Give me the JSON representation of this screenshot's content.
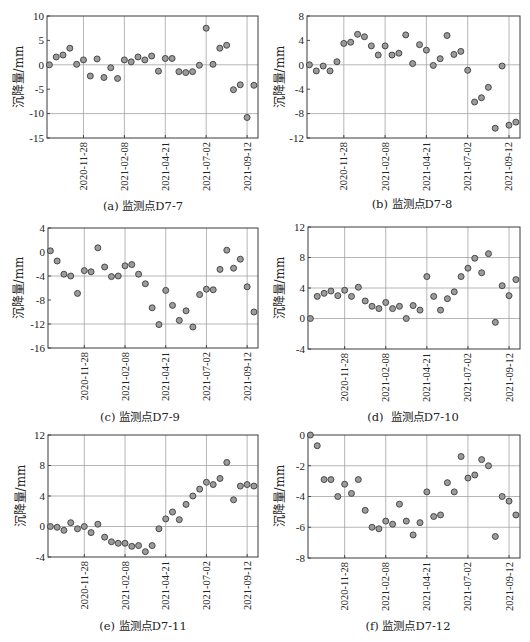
{
  "figure": {
    "panel_count": 6,
    "marker_fill": "#9b9b9b",
    "marker_stroke": "#3c3c3c",
    "grid_color": "#a3a3a3"
  },
  "chart_data": [
    {
      "type": "scatter",
      "title": "(a) 监测点D7-7",
      "xlabel": "",
      "ylabel": "沉降量/mm",
      "ylim": [
        -15,
        10
      ],
      "yticks": [
        10,
        5,
        0,
        -5,
        -10,
        -15
      ],
      "hgrid": [
        0,
        -10
      ],
      "xticks": [
        "2020-11-28",
        "2021-02-08",
        "2021-04-21",
        "2021-07-02",
        "2021-09-12"
      ],
      "x": [
        "2020-09-29",
        "2020-10-11",
        "2020-10-23",
        "2020-11-04",
        "2020-11-16",
        "2020-11-28",
        "2020-12-10",
        "2020-12-22",
        "2021-01-03",
        "2021-01-15",
        "2021-01-27",
        "2021-02-08",
        "2021-02-20",
        "2021-03-04",
        "2021-03-16",
        "2021-03-28",
        "2021-04-09",
        "2021-04-21",
        "2021-05-03",
        "2021-05-15",
        "2021-05-27",
        "2021-06-08",
        "2021-06-20",
        "2021-07-02",
        "2021-07-14",
        "2021-07-26",
        "2021-08-07",
        "2021-08-19",
        "2021-08-31",
        "2021-09-12",
        "2021-09-24"
      ],
      "y": [
        0,
        1.6,
        2.0,
        3.4,
        0.1,
        1.0,
        -2.3,
        1.2,
        -2.6,
        -0.6,
        -2.8,
        1.0,
        0.6,
        1.6,
        1.0,
        1.8,
        -1.3,
        1.3,
        1.3,
        -1.4,
        -1.6,
        -1.4,
        -0.1,
        7.5,
        0.1,
        3.4,
        4.0,
        -5.1,
        -4.1,
        -10.8,
        -4.2
      ]
    },
    {
      "type": "scatter",
      "title": "(b) 监测点D7-8",
      "xlabel": "",
      "ylabel": "沉降量/mm",
      "ylim": [
        -12,
        8
      ],
      "yticks": [
        8,
        4,
        0,
        -4,
        -8,
        -12
      ],
      "hgrid": [
        0,
        -8
      ],
      "xticks": [
        "2020-11-28",
        "2021-02-08",
        "2021-04-21",
        "2021-07-02",
        "2021-09-12"
      ],
      "x": [
        "2020-09-29",
        "2020-10-11",
        "2020-10-23",
        "2020-11-04",
        "2020-11-16",
        "2020-11-28",
        "2020-12-10",
        "2020-12-22",
        "2021-01-03",
        "2021-01-15",
        "2021-01-27",
        "2021-02-08",
        "2021-02-20",
        "2021-03-04",
        "2021-03-16",
        "2021-03-28",
        "2021-04-09",
        "2021-04-21",
        "2021-05-03",
        "2021-05-15",
        "2021-05-27",
        "2021-06-08",
        "2021-06-20",
        "2021-07-02",
        "2021-07-14",
        "2021-07-26",
        "2021-08-07",
        "2021-08-19",
        "2021-08-31",
        "2021-09-12",
        "2021-09-24"
      ],
      "y": [
        0,
        -1.0,
        -0.2,
        -1.0,
        0.5,
        3.5,
        3.7,
        5.0,
        4.6,
        3.1,
        1.6,
        3.1,
        1.6,
        1.9,
        4.9,
        0.2,
        3.3,
        2.4,
        -0.1,
        1.0,
        4.8,
        1.7,
        2.2,
        -0.9,
        -6.1,
        -5.4,
        -3.7,
        -10.4,
        -0.2,
        -9.9,
        -9.4
      ]
    },
    {
      "type": "scatter",
      "title": "(c) 监测点D7-9",
      "xlabel": "",
      "ylabel": "沉降量/mm",
      "ylim": [
        -16,
        4
      ],
      "yticks": [
        4,
        0,
        -4,
        -8,
        -12,
        -16
      ],
      "hgrid": [
        -4,
        -12
      ],
      "xticks": [
        "2020-11-28",
        "2021-02-08",
        "2021-04-21",
        "2021-07-02",
        "2021-09-12"
      ],
      "x": [
        "2020-09-29",
        "2020-10-11",
        "2020-10-23",
        "2020-11-04",
        "2020-11-16",
        "2020-11-28",
        "2020-12-10",
        "2020-12-22",
        "2021-01-03",
        "2021-01-15",
        "2021-01-27",
        "2021-02-08",
        "2021-02-20",
        "2021-03-04",
        "2021-03-16",
        "2021-03-28",
        "2021-04-09",
        "2021-04-21",
        "2021-05-03",
        "2021-05-15",
        "2021-05-27",
        "2021-06-08",
        "2021-06-20",
        "2021-07-02",
        "2021-07-14",
        "2021-07-26",
        "2021-08-07",
        "2021-08-19",
        "2021-08-31",
        "2021-09-12",
        "2021-09-24"
      ],
      "y": [
        0.2,
        -1.5,
        -3.7,
        -4.0,
        -6.9,
        -3.1,
        -3.3,
        0.7,
        -2.5,
        -4.1,
        -4.0,
        -2.3,
        -2.1,
        -3.7,
        -5.3,
        -9.3,
        -12.1,
        -6.4,
        -8.9,
        -11.4,
        -9.8,
        -12.5,
        -7.1,
        -6.2,
        -6.3,
        -2.9,
        0.3,
        -2.7,
        -1.2,
        -5.8,
        -10.0
      ]
    },
    {
      "type": "scatter",
      "title": "(d)  监测点D7-10",
      "xlabel": "",
      "ylabel": "沉降量/mm",
      "ylim": [
        -4,
        12
      ],
      "yticks": [
        12,
        8,
        4,
        0,
        -4
      ],
      "hgrid": [
        8,
        4,
        0
      ],
      "xticks": [
        "2020-11-28",
        "2021-02-08",
        "2021-04-21",
        "2021-07-02",
        "2021-09-12"
      ],
      "x": [
        "2020-09-29",
        "2020-10-11",
        "2020-10-23",
        "2020-11-04",
        "2020-11-16",
        "2020-11-28",
        "2020-12-10",
        "2020-12-22",
        "2021-01-03",
        "2021-01-15",
        "2021-01-27",
        "2021-02-08",
        "2021-02-20",
        "2021-03-04",
        "2021-03-16",
        "2021-03-28",
        "2021-04-09",
        "2021-04-21",
        "2021-05-03",
        "2021-05-15",
        "2021-05-27",
        "2021-06-08",
        "2021-06-20",
        "2021-07-02",
        "2021-07-14",
        "2021-07-26",
        "2021-08-07",
        "2021-08-19",
        "2021-08-31",
        "2021-09-12",
        "2021-09-24"
      ],
      "y": [
        0,
        2.9,
        3.3,
        3.6,
        3.0,
        3.7,
        2.9,
        4.1,
        2.3,
        1.6,
        1.3,
        2.1,
        1.3,
        1.6,
        0,
        1.7,
        1.1,
        5.5,
        2.9,
        1.1,
        2.6,
        3.5,
        5.5,
        6.6,
        7.9,
        6.0,
        8.5,
        -0.5,
        4.3,
        3.0,
        5.1
      ]
    },
    {
      "type": "scatter",
      "title": "(e) 监测点D7-11",
      "xlabel": "",
      "ylabel": "沉降量/mm",
      "ylim": [
        -4,
        12
      ],
      "yticks": [
        12,
        8,
        4,
        0,
        -4
      ],
      "hgrid": [
        8,
        4,
        0
      ],
      "xticks": [
        "2020-11-28",
        "2021-02-08",
        "2021-04-21",
        "2021-07-02",
        "2021-09-12"
      ],
      "x": [
        "2020-09-29",
        "2020-10-11",
        "2020-10-23",
        "2020-11-04",
        "2020-11-16",
        "2020-11-28",
        "2020-12-10",
        "2020-12-22",
        "2021-01-03",
        "2021-01-15",
        "2021-01-27",
        "2021-02-08",
        "2021-02-20",
        "2021-03-04",
        "2021-03-16",
        "2021-03-28",
        "2021-04-09",
        "2021-04-21",
        "2021-05-03",
        "2021-05-15",
        "2021-05-27",
        "2021-06-08",
        "2021-06-20",
        "2021-07-02",
        "2021-07-14",
        "2021-07-26",
        "2021-08-07",
        "2021-08-19",
        "2021-08-31",
        "2021-09-12",
        "2021-09-24"
      ],
      "y": [
        0,
        -0.1,
        -0.5,
        0.5,
        -0.3,
        0,
        -0.8,
        0.3,
        -1.4,
        -2.0,
        -2.2,
        -2.2,
        -2.6,
        -2.5,
        -3.3,
        -2.5,
        -0.3,
        1.0,
        1.9,
        0.9,
        2.9,
        4.0,
        4.9,
        5.8,
        5.5,
        6.3,
        8.4,
        3.5,
        5.3,
        5.5,
        5.3
      ]
    },
    {
      "type": "scatter",
      "title": "(f) 监测点D7-12",
      "xlabel": "",
      "ylabel": "沉降量/mm",
      "ylim": [
        -8,
        0
      ],
      "yticks": [
        0,
        -2,
        -4,
        -6,
        -8
      ],
      "hgrid": [
        -2,
        -4,
        -6
      ],
      "xticks": [
        "2020-11-28",
        "2021-02-08",
        "2021-04-21",
        "2021-07-02",
        "2021-09-12"
      ],
      "x": [
        "2020-09-29",
        "2020-10-11",
        "2020-10-23",
        "2020-11-04",
        "2020-11-16",
        "2020-11-28",
        "2020-12-10",
        "2020-12-22",
        "2021-01-03",
        "2021-01-15",
        "2021-01-27",
        "2021-02-08",
        "2021-02-20",
        "2021-03-04",
        "2021-03-16",
        "2021-03-28",
        "2021-04-09",
        "2021-04-21",
        "2021-05-03",
        "2021-05-15",
        "2021-05-27",
        "2021-06-08",
        "2021-06-20",
        "2021-07-02",
        "2021-07-14",
        "2021-07-26",
        "2021-08-07",
        "2021-08-19",
        "2021-08-31",
        "2021-09-12",
        "2021-09-24"
      ],
      "y": [
        0,
        -0.7,
        -2.9,
        -2.9,
        -4.0,
        -3.2,
        -3.8,
        -2.9,
        -4.9,
        -6.0,
        -6.1,
        -5.6,
        -5.8,
        -4.5,
        -5.6,
        -6.5,
        -5.7,
        -3.7,
        -5.3,
        -5.2,
        -3.1,
        -3.7,
        -1.4,
        -2.8,
        -2.6,
        -1.6,
        -2.0,
        -6.6,
        -4.0,
        -4.3,
        -5.2
      ]
    }
  ]
}
